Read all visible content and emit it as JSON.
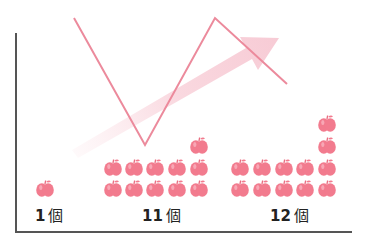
{
  "groups": [
    {
      "count_label": "1",
      "unit": "個",
      "apples": 1
    },
    {
      "count_label": "11",
      "unit": "個",
      "apples": 11
    },
    {
      "count_label": "12",
      "unit": "個",
      "apples": 12
    }
  ],
  "colors": {
    "apple": "#f27b8e",
    "apple_highlight": "#f9b3bf",
    "line": "#ec8a9c",
    "arrow": "#f9d4dc",
    "axis": "#555555"
  },
  "zigzag_line": [
    [
      74,
      18
    ],
    [
      145,
      145
    ],
    [
      215,
      18
    ],
    [
      287,
      84
    ]
  ],
  "trend_arrow": {
    "from": [
      72,
      150
    ],
    "to": [
      279,
      38
    ]
  }
}
